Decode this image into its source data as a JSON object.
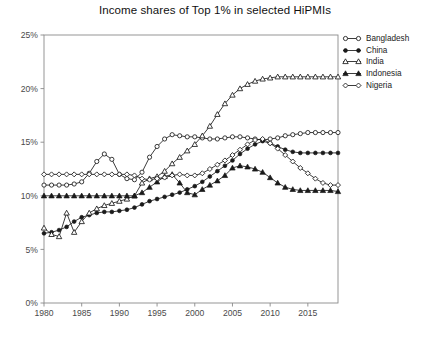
{
  "chart_data": {
    "type": "line",
    "title": "Income shares of Top 1% in selected HiPMIs",
    "xlabel": "",
    "ylabel": "",
    "xlim": [
      1980,
      2019
    ],
    "ylim": [
      0,
      25
    ],
    "grid": false,
    "legend_position": "right",
    "y_unit": "%",
    "y_tick_labels": [
      "0%",
      "5%",
      "10%",
      "15%",
      "20%",
      "25%"
    ],
    "y_ticks": [
      0,
      5,
      10,
      15,
      20,
      25
    ],
    "x_tick_labels": [
      "1980",
      "1985",
      "1990",
      "1995",
      "2000",
      "2005",
      "2010",
      "2015"
    ],
    "x_ticks": [
      1980,
      1985,
      1990,
      1995,
      2000,
      2005,
      2010,
      2015
    ],
    "x": [
      1980,
      1981,
      1982,
      1983,
      1984,
      1985,
      1986,
      1987,
      1988,
      1989,
      1990,
      1991,
      1992,
      1993,
      1994,
      1995,
      1996,
      1997,
      1998,
      1999,
      2000,
      2001,
      2002,
      2003,
      2004,
      2005,
      2006,
      2007,
      2008,
      2009,
      2010,
      2011,
      2012,
      2013,
      2014,
      2015,
      2016,
      2017,
      2018,
      2019
    ],
    "series": [
      {
        "name": "Bangladesh",
        "marker": "open-circle",
        "values": [
          11.0,
          11.0,
          11.0,
          11.0,
          11.1,
          11.3,
          12.1,
          13.2,
          13.9,
          13.4,
          12.0,
          11.6,
          11.5,
          12.2,
          13.6,
          14.6,
          15.3,
          15.7,
          15.6,
          15.5,
          15.5,
          15.4,
          15.3,
          15.3,
          15.4,
          15.5,
          15.5,
          15.4,
          15.3,
          15.2,
          15.3,
          15.4,
          15.6,
          15.7,
          15.8,
          15.9,
          15.9,
          15.9,
          15.9,
          15.9
        ]
      },
      {
        "name": "China",
        "marker": "filled-circle",
        "values": [
          6.5,
          6.6,
          6.8,
          7.1,
          7.6,
          8.0,
          8.2,
          8.4,
          8.5,
          8.5,
          8.6,
          8.7,
          8.9,
          9.2,
          9.5,
          9.7,
          9.9,
          10.1,
          10.3,
          10.6,
          10.9,
          11.3,
          11.8,
          12.3,
          12.8,
          13.3,
          13.9,
          14.4,
          14.8,
          15.1,
          14.9,
          14.6,
          14.3,
          14.1,
          14.0,
          14.0,
          14.0,
          14.0,
          14.0,
          14.0
        ]
      },
      {
        "name": "India",
        "marker": "open-triangle",
        "values": [
          7.0,
          6.4,
          6.2,
          8.4,
          6.6,
          7.6,
          8.4,
          8.8,
          9.1,
          9.3,
          9.5,
          9.7,
          10.0,
          11.2,
          11.6,
          11.8,
          12.3,
          13.0,
          13.6,
          14.2,
          14.8,
          15.6,
          16.5,
          17.6,
          18.6,
          19.4,
          20.0,
          20.4,
          20.7,
          20.9,
          21.0,
          21.1,
          21.1,
          21.1,
          21.1,
          21.1,
          21.1,
          21.1,
          21.1,
          21.1
        ]
      },
      {
        "name": "Indonesia",
        "marker": "filled-triangle",
        "values": [
          10.0,
          10.0,
          10.0,
          10.0,
          10.0,
          10.0,
          10.0,
          10.0,
          10.0,
          10.0,
          10.0,
          10.0,
          10.0,
          10.3,
          10.8,
          11.3,
          11.8,
          12.0,
          11.2,
          10.3,
          10.1,
          10.6,
          11.0,
          11.4,
          11.9,
          12.6,
          12.8,
          12.7,
          12.5,
          12.2,
          11.7,
          11.2,
          10.8,
          10.6,
          10.5,
          10.5,
          10.5,
          10.5,
          10.5,
          10.4
        ]
      },
      {
        "name": "Nigeria",
        "marker": "open-diamond",
        "values": [
          12.0,
          12.0,
          12.0,
          12.0,
          12.0,
          12.0,
          12.0,
          12.0,
          12.0,
          12.0,
          12.0,
          12.0,
          11.9,
          11.6,
          11.5,
          11.6,
          11.7,
          11.9,
          12.0,
          11.9,
          11.9,
          12.1,
          12.5,
          12.9,
          13.3,
          13.8,
          14.3,
          14.8,
          15.2,
          15.3,
          14.9,
          14.4,
          13.8,
          13.2,
          12.6,
          12.1,
          11.6,
          11.2,
          11.0,
          11.0
        ]
      }
    ]
  },
  "legend": {
    "items": [
      {
        "label": "Bangladesh"
      },
      {
        "label": "China"
      },
      {
        "label": "India"
      },
      {
        "label": "Indonesia"
      },
      {
        "label": "Nigeria"
      }
    ]
  },
  "caption": {
    "text": ""
  },
  "colors": {
    "line": "#1a1a1a",
    "axis": "#8a8a8a",
    "text": "#1a1a1a",
    "tick": "#4a4a4a",
    "background": "#ffffff"
  }
}
